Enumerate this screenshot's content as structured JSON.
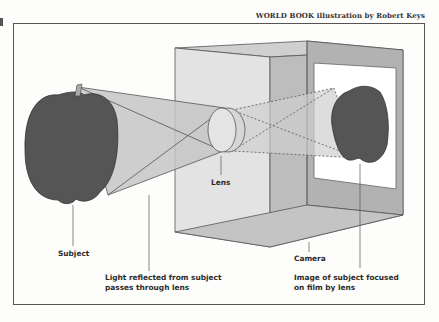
{
  "credit": "WORLD BOOK illustration by Robert Keys",
  "labels": {
    "lens": "Lens",
    "subject": "Subject",
    "camera": "Camera",
    "light_line1": "Light reflected from subject",
    "light_line2": "passes through lens",
    "image_line1": "Image of subject focused",
    "image_line2": "on film by lens"
  },
  "colors": {
    "apple": "#555555",
    "box_front": "#dcdcdc",
    "box_side": "#b9b9b9",
    "light_beam": "#c8c8c8",
    "film": "#ffffff"
  }
}
